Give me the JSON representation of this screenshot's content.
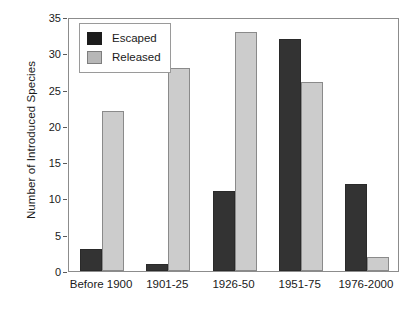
{
  "chart_data": {
    "type": "bar",
    "title": "",
    "subtitle": "",
    "xlabel": "",
    "ylabel": "Number of Introduced Species",
    "categories": [
      "Before 1900",
      "1901-25",
      "1926-50",
      "1951-75",
      "1976-2000"
    ],
    "series": [
      {
        "name": "Escaped",
        "color": "#333333",
        "values": [
          3,
          1,
          11,
          32,
          12
        ]
      },
      {
        "name": "Released",
        "color": "#cccccc",
        "values": [
          22,
          28,
          33,
          26,
          2
        ]
      }
    ],
    "ylim": [
      0,
      35
    ],
    "ytick_step": 5,
    "yticks": [
      0,
      5,
      10,
      15,
      20,
      25,
      30,
      35
    ],
    "ytick_labels": [
      "0",
      "5",
      "10",
      "15",
      "20",
      "25",
      "30",
      "35"
    ],
    "grid": false,
    "legend_position": "top-left-inside",
    "legend_entries": [
      "Escaped",
      "Released"
    ],
    "annotations": []
  },
  "axes": {
    "y_title": "Number of Introduced Species"
  },
  "legend": {
    "items": [
      {
        "label": "Escaped"
      },
      {
        "label": "Released"
      }
    ]
  }
}
